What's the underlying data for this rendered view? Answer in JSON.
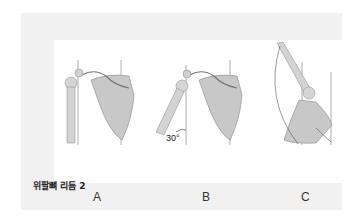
{
  "figure": {
    "panels": [
      {
        "id": "A",
        "label": "A",
        "description": "arm at rest beside scapula"
      },
      {
        "id": "B",
        "label": "B",
        "description": "arm abducted 30 degrees",
        "angle_label": "30°"
      },
      {
        "id": "C",
        "label": "C",
        "description": "arm fully elevated with scapular rotation"
      }
    ],
    "caption": "위팔뼈 리듬 2"
  }
}
